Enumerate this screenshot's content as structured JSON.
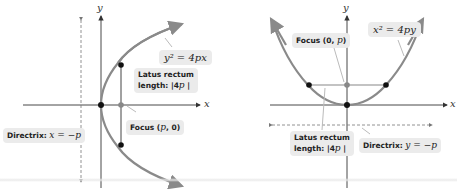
{
  "left_diagram": {
    "equation": "y² = 4px",
    "axis_x_label": "x",
    "axis_y_label": "y",
    "latus_rectum_label_line1": "Latus rectum",
    "latus_rectum_label_line2_prefix": "length: |4",
    "latus_rectum_label_line2_var": "p",
    "latus_rectum_label_line2_suffix": " |",
    "focus_label_prefix": "Focus (",
    "focus_label_math": "p",
    "focus_label_suffix": ", 0)",
    "directrix_label_prefix": "Directrix: ",
    "directrix_label_math": "x = −p"
  },
  "right_diagram": {
    "equation": "x² = 4py",
    "axis_x_label": "x",
    "axis_y_label": "y",
    "focus_label_prefix": "Focus (0, ",
    "focus_label_math": "p",
    "focus_label_suffix": ")",
    "latus_rectum_label_line1": "Latus rectum",
    "latus_rectum_label_line2_prefix": "length: |4",
    "latus_rectum_label_line2_var": "p",
    "latus_rectum_label_line2_suffix": " |",
    "directrix_label_prefix": "Directrix: ",
    "directrix_label_math": "y = −p"
  },
  "colors": {
    "curve": "#8a8a8a",
    "axis": "#333333",
    "label_bg": "#ebebeb",
    "point": "#111111",
    "focus_point": "#888888"
  }
}
